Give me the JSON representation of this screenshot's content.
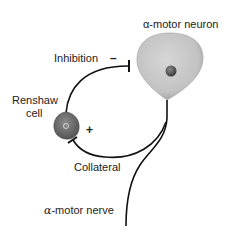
{
  "diagram": {
    "labels": {
      "motor_neuron": "α-motor neuron",
      "inhibition": "Inhibition",
      "inhibition_sign": "–",
      "renshaw_line1": "Renshaw",
      "renshaw_line2": "cell",
      "excitation_sign": "+",
      "collateral": "Collateral",
      "motor_nerve_alpha": "α",
      "motor_nerve_rest": "-motor nerve"
    },
    "colors": {
      "motor_neuron_body": "#c8c8c8",
      "motor_neuron_nucleus": "#555555",
      "renshaw_body": "#777777",
      "axon": "#111111",
      "background": "#ffffff"
    }
  }
}
